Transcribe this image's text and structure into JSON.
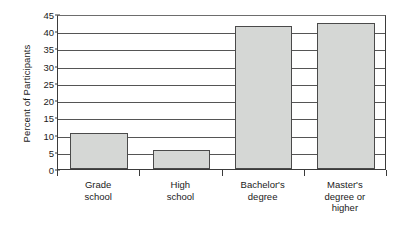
{
  "chart_data": {
    "type": "bar",
    "title": "",
    "xlabel": "",
    "ylabel": "Percent of Participants",
    "categories": [
      "Grade school",
      "High school",
      "Bachelor's degree",
      "Master's degree or higher"
    ],
    "category_lines": [
      [
        "Grade",
        "school"
      ],
      [
        "High",
        "school"
      ],
      [
        "Bachelor's",
        "degree"
      ],
      [
        "Master's",
        "degree or",
        "higher"
      ]
    ],
    "values": [
      10.6,
      5.4,
      41.5,
      42.5
    ],
    "ylim": [
      0,
      45
    ],
    "ytick_step": 5,
    "yticks": [
      0,
      5,
      10,
      15,
      20,
      25,
      30,
      35,
      40,
      45
    ],
    "ytick_labels": [
      "0",
      "5",
      "10",
      "15",
      "20",
      "25",
      "30",
      "35",
      "40",
      "45"
    ],
    "grid": "horizontal",
    "legend": "none",
    "bar_fill_color": "#d5d7d5",
    "bar_border_color": "#4a4a4a",
    "gridline_color": "#555555",
    "axis_color": "#3b3b3b",
    "background_color": "#ffffff"
  }
}
